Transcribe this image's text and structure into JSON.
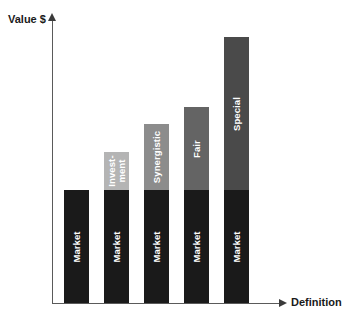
{
  "chart_data": {
    "type": "bar",
    "title": "",
    "subtitle": "",
    "xlabel": "Definition",
    "ylabel": "Value $",
    "grid": false,
    "legend": "none",
    "stacked": true,
    "axis_ticks": {
      "x": [],
      "y": []
    },
    "categories": [
      "1",
      "2",
      "3",
      "4",
      "5"
    ],
    "series": [
      {
        "name": "Market",
        "color": "#1a1a1a",
        "values": [
          113,
          113,
          113,
          113,
          113
        ]
      },
      {
        "name": "Premium",
        "values": [
          0,
          38,
          66,
          83,
          153
        ]
      }
    ],
    "bars": [
      {
        "index": 1,
        "total": 113,
        "segments": [
          {
            "label": "Market",
            "value": 113,
            "color": "#1a1a1a",
            "text_color": "#ffffff"
          }
        ]
      },
      {
        "index": 2,
        "total": 151,
        "segments": [
          {
            "label": "Market",
            "value": 113,
            "color": "#1a1a1a",
            "text_color": "#ffffff"
          },
          {
            "label": "Invest-ment",
            "value": 38,
            "color": "#b4b4b4",
            "text_color": "#ffffff"
          }
        ]
      },
      {
        "index": 3,
        "total": 179,
        "segments": [
          {
            "label": "Market",
            "value": 113,
            "color": "#1a1a1a",
            "text_color": "#ffffff"
          },
          {
            "label": "Synergistic",
            "value": 66,
            "color": "#8c8c8c",
            "text_color": "#ffffff"
          }
        ]
      },
      {
        "index": 4,
        "total": 196,
        "segments": [
          {
            "label": "Market",
            "value": 113,
            "color": "#1a1a1a",
            "text_color": "#ffffff"
          },
          {
            "label": "Fair",
            "value": 83,
            "color": "#646464",
            "text_color": "#ffffff"
          }
        ]
      },
      {
        "index": 5,
        "total": 266,
        "segments": [
          {
            "label": "Market",
            "value": 113,
            "color": "#1a1a1a",
            "text_color": "#ffffff"
          },
          {
            "label": "Special",
            "value": 153,
            "color": "#4a4a4a",
            "text_color": "#ffffff"
          }
        ]
      }
    ],
    "axis_color": "#5a5a5a",
    "background": "#ffffff"
  },
  "labels": {
    "bar1_market": "Market",
    "bar2_market": "Market",
    "bar2_top": "Invest-\nment",
    "bar3_market": "Market",
    "bar3_top": "Synergistic",
    "bar4_market": "Market",
    "bar4_top": "Fair",
    "bar5_market": "Market",
    "bar5_top": "Special"
  },
  "axes": {
    "y_title": "Value $",
    "x_title": "Definition"
  }
}
